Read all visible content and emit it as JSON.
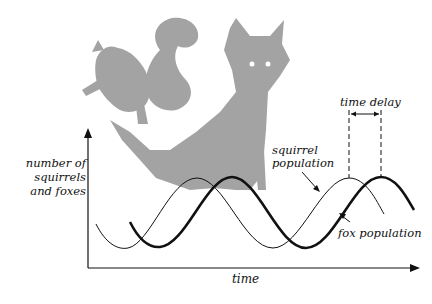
{
  "diagram": {
    "y_axis_label": "number of squirrels and foxes",
    "y_axis_lines": [
      "number of",
      "squirrels",
      "and foxes"
    ],
    "x_axis_label": "time",
    "squirrel_label_lines": [
      "squirrel",
      "population"
    ],
    "fox_label": "fox population",
    "time_delay_label": "time delay",
    "illustration": [
      "squirrel",
      "fox"
    ],
    "colors": {
      "illustration": "#a3a3a3",
      "lines": "#111111",
      "background": "#ffffff"
    }
  }
}
